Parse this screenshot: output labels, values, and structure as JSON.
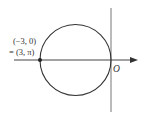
{
  "diagram": {
    "type": "polar-circle",
    "point_label_line1": "(−3, 0)",
    "point_label_line2": "= (3, π)",
    "origin_label": "O",
    "colors": {
      "stroke": "#333333",
      "axis": "#555555",
      "background": "#ffffff"
    },
    "circle": {
      "center_cartesian": [
        -1.5,
        0
      ],
      "radius": 1.5
    },
    "marked_point": {
      "cartesian": [
        -3,
        0
      ],
      "polar": [
        3,
        "π"
      ]
    }
  }
}
